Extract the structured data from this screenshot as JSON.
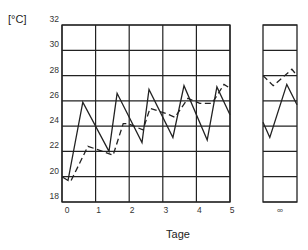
{
  "chart_data": {
    "type": "line",
    "title": "",
    "unit_label": "[°C]",
    "xlabel": "Tage",
    "ylabel": "[°C]",
    "ylim": [
      18,
      32
    ],
    "xlim": [
      0,
      5
    ],
    "yticks": [
      "18",
      "20",
      "22",
      "24",
      "26",
      "28",
      "30",
      "32"
    ],
    "xticks": [
      "0",
      "1",
      "2",
      "3",
      "4",
      "5"
    ],
    "grid": true,
    "legend": "none",
    "series": [
      {
        "name": "solid",
        "style": "solid",
        "points": [
          [
            0.0,
            20.0
          ],
          [
            0.18,
            19.7
          ],
          [
            0.62,
            25.9
          ],
          [
            1.4,
            22.0
          ],
          [
            1.64,
            26.6
          ],
          [
            2.38,
            22.7
          ],
          [
            2.59,
            26.9
          ],
          [
            3.3,
            23.1
          ],
          [
            3.63,
            27.2
          ],
          [
            4.32,
            22.9
          ],
          [
            4.61,
            27.1
          ],
          [
            5.0,
            24.9
          ]
        ]
      },
      {
        "name": "dashed",
        "style": "dashed",
        "points": [
          [
            0.27,
            19.7
          ],
          [
            0.77,
            22.4
          ],
          [
            1.0,
            22.2
          ],
          [
            1.52,
            21.7
          ],
          [
            1.82,
            24.2
          ],
          [
            1.96,
            24.2
          ],
          [
            2.41,
            23.7
          ],
          [
            2.62,
            25.4
          ],
          [
            3.1,
            25.0
          ],
          [
            3.36,
            24.7
          ],
          [
            3.75,
            26.2
          ],
          [
            4.1,
            25.8
          ],
          [
            4.46,
            25.8
          ],
          [
            4.82,
            27.3
          ],
          [
            5.0,
            27.0
          ]
        ]
      }
    ],
    "infinity_panel": {
      "xtick": "∞",
      "series": [
        {
          "name": "solid",
          "style": "solid",
          "points": [
            [
              0.0,
              24.3
            ],
            [
              0.2,
              23.1
            ],
            [
              0.7,
              27.3
            ],
            [
              1.0,
              25.7
            ]
          ]
        },
        {
          "name": "dashed",
          "style": "dashed",
          "points": [
            [
              0.0,
              28.0
            ],
            [
              0.3,
              27.2
            ],
            [
              0.85,
              28.5
            ],
            [
              1.0,
              28.0
            ]
          ]
        }
      ]
    }
  }
}
